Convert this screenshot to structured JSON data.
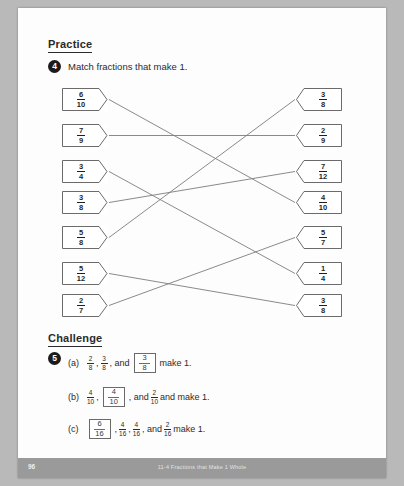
{
  "page": {
    "background_color": "#b9b9b9",
    "paper_color": "#fdfdfd"
  },
  "practice": {
    "heading": "Practice",
    "question_number": "4",
    "instruction": "Match fractions that make 1."
  },
  "match": {
    "left_column": [
      {
        "num": "6",
        "den": "10"
      },
      {
        "num": "7",
        "den": "9"
      },
      {
        "num": "3",
        "den": "4"
      },
      {
        "num": "3",
        "den": "8"
      },
      {
        "num": "5",
        "den": "8"
      },
      {
        "num": "5",
        "den": "12"
      },
      {
        "num": "2",
        "den": "7"
      }
    ],
    "right_column": [
      {
        "num": "3",
        "den": "8"
      },
      {
        "num": "2",
        "den": "9"
      },
      {
        "num": "7",
        "den": "12"
      },
      {
        "num": "4",
        "den": "10"
      },
      {
        "num": "5",
        "den": "7"
      },
      {
        "num": "1",
        "den": "4"
      },
      {
        "num": "3",
        "den": "8"
      }
    ],
    "connections": [
      {
        "left_index": 0,
        "right_index": 3
      },
      {
        "left_index": 1,
        "right_index": 1
      },
      {
        "left_index": 2,
        "right_index": 5
      },
      {
        "left_index": 3,
        "right_index": 2
      },
      {
        "left_index": 4,
        "right_index": 0
      },
      {
        "left_index": 5,
        "right_index": 6
      },
      {
        "left_index": 6,
        "right_index": 4
      }
    ],
    "line_color": "#7d7d7d",
    "tag_border_color": "#5a5a5a"
  },
  "challenge": {
    "heading": "Challenge",
    "question_number": "5",
    "items": [
      {
        "label": "(a)",
        "parts": [
          {
            "type": "fraction",
            "num": "2",
            "den": "8"
          },
          {
            "type": "text",
            "value": ","
          },
          {
            "type": "fraction",
            "num": "3",
            "den": "8"
          },
          {
            "type": "text",
            "value": ", and"
          },
          {
            "type": "boxed",
            "num": "3",
            "den": "8"
          },
          {
            "type": "text",
            "value": "make 1."
          }
        ]
      },
      {
        "label": "(b)",
        "parts": [
          {
            "type": "fraction",
            "num": "4",
            "den": "10"
          },
          {
            "type": "text",
            "value": ","
          },
          {
            "type": "boxed",
            "num": "4",
            "den": "10"
          },
          {
            "type": "text",
            "value": ", and"
          },
          {
            "type": "fraction",
            "num": "2",
            "den": "10"
          },
          {
            "type": "text",
            "value": "and make 1."
          }
        ]
      },
      {
        "label": "(c)",
        "parts": [
          {
            "type": "boxed",
            "num": "6",
            "den": "16"
          },
          {
            "type": "text",
            "value": ","
          },
          {
            "type": "fraction",
            "num": "4",
            "den": "16"
          },
          {
            "type": "text",
            "value": ","
          },
          {
            "type": "fraction",
            "num": "4",
            "den": "16"
          },
          {
            "type": "text",
            "value": ", and"
          },
          {
            "type": "fraction",
            "num": "2",
            "den": "16"
          },
          {
            "type": "text",
            "value": "make 1."
          }
        ]
      }
    ]
  },
  "footer": {
    "page_number": "96",
    "title": "11-4 Fractions that Make 1 Whole",
    "background_color": "#9a9a9a"
  }
}
